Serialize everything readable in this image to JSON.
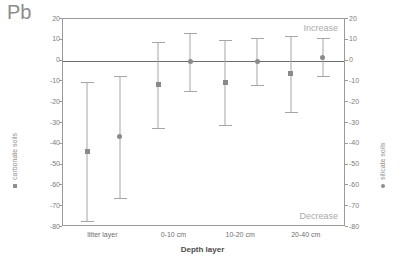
{
  "chart_data": {
    "type": "scatter",
    "title": "Pb",
    "xlabel": "Depth layer",
    "ylabel": "",
    "ylim": [
      -80,
      20
    ],
    "yticks": [
      20,
      10,
      0,
      -10,
      -20,
      -30,
      -40,
      -50,
      -60,
      -70,
      -80
    ],
    "ytick_labels": [
      "20",
      "10",
      "0",
      "-10",
      "-20",
      "-30",
      "-40",
      "-50",
      "-60",
      "-70",
      "-80"
    ],
    "right_axis": {
      "ylim": [
        -80,
        20
      ],
      "yticks": [
        20,
        10,
        0,
        -10,
        -20,
        -30,
        -40,
        -50,
        -60,
        -70,
        -80
      ],
      "ytick_labels": [
        "20",
        "10",
        "0",
        "-10",
        "-20",
        "-30",
        "-40",
        "-50",
        "-60",
        "-70",
        "-80"
      ]
    },
    "categories": [
      "litter layer",
      "0-10 cm",
      "10-20 cm",
      "20-40 cm"
    ],
    "grid": false,
    "legend_position": "outside-left-and-right",
    "annotations": [
      {
        "text": "Increase",
        "position": "top-right"
      },
      {
        "text": "Decrease",
        "position": "bottom-right"
      }
    ],
    "reference_line": {
      "value": 0,
      "label": "zero-line"
    },
    "series": [
      {
        "name": "carbonate soils",
        "marker": "square",
        "axis": "left",
        "color": "#8a8a8a",
        "values": [
          -43.5,
          -11.5,
          -10.5,
          -6.0
        ],
        "upper": [
          -10.5,
          9.0,
          10.0,
          12.0
        ],
        "lower": [
          -77.0,
          -32.5,
          -31.0,
          -24.5
        ]
      },
      {
        "name": "silicate soils",
        "marker": "circle",
        "axis": "right",
        "color": "#8a8a8a",
        "values": [
          -36.5,
          -0.5,
          -0.5,
          1.5
        ],
        "upper": [
          -7.5,
          13.5,
          11.0,
          11.0
        ],
        "lower": [
          -66.0,
          -14.5,
          -11.5,
          -7.5
        ]
      }
    ],
    "points": [
      {
        "group": "litter layer",
        "series": "carbonate soils",
        "x_px_ratio": 0.085,
        "mean": -43.5,
        "upper": -10.5,
        "lower": -77.0,
        "marker": "square"
      },
      {
        "group": "litter layer",
        "series": "silicate soils",
        "x_px_ratio": 0.2,
        "mean": -36.5,
        "upper": -7.5,
        "lower": -66.0,
        "marker": "circle"
      },
      {
        "group": "0-10 cm",
        "series": "carbonate soils",
        "x_px_ratio": 0.337,
        "mean": -11.5,
        "upper": 9.0,
        "lower": -32.5,
        "marker": "square"
      },
      {
        "group": "0-10 cm",
        "series": "silicate soils",
        "x_px_ratio": 0.45,
        "mean": -0.5,
        "upper": 13.5,
        "lower": -14.5,
        "marker": "circle"
      },
      {
        "group": "10-20 cm",
        "series": "carbonate soils",
        "x_px_ratio": 0.573,
        "mean": -10.5,
        "upper": 10.0,
        "lower": -31.0,
        "marker": "square"
      },
      {
        "group": "10-20 cm",
        "series": "silicate soils",
        "x_px_ratio": 0.686,
        "mean": -0.5,
        "upper": 11.0,
        "lower": -11.5,
        "marker": "circle"
      },
      {
        "group": "20-40 cm",
        "series": "carbonate soils",
        "x_px_ratio": 0.805,
        "mean": -6.0,
        "upper": 12.0,
        "lower": -24.5,
        "marker": "square"
      },
      {
        "group": "20-40 cm",
        "series": "silicate soils",
        "x_px_ratio": 0.918,
        "mean": 1.5,
        "upper": 11.0,
        "lower": -7.5,
        "marker": "circle"
      }
    ]
  },
  "legends": {
    "left": {
      "label": "carbonate soils",
      "marker": "square"
    },
    "right": {
      "label": "silicate soils",
      "marker": "circle"
    }
  }
}
